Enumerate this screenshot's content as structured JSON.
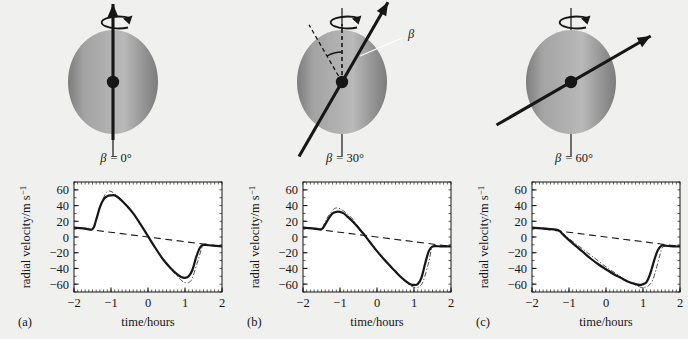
{
  "figure": {
    "background_color": "#f0f0ee",
    "ink_color": "#161616",
    "sphere_light_color": "#b9b9b9",
    "sphere_dark_color": "#7d7d7d",
    "panel_count": 3
  },
  "panels": [
    {
      "letter": "(a)",
      "beta_label": "β = 0°",
      "beta_symbol": "β",
      "beta_value_text": "= 0°",
      "beta_degrees": 0,
      "arrow_angle_from_vertical_deg": 90,
      "has_angle_arc": false,
      "has_beta_leader": false
    },
    {
      "letter": "(b)",
      "beta_label": "β = 30°",
      "beta_symbol": "β",
      "beta_value_text": "= 30°",
      "beta_degrees": 30,
      "arrow_angle_from_vertical_deg": 60,
      "has_angle_arc": true,
      "has_beta_leader": true
    },
    {
      "letter": "(c)",
      "beta_label": "β = 60°",
      "beta_symbol": "β",
      "beta_value_text": "= 60°",
      "beta_degrees": 60,
      "arrow_angle_from_vertical_deg": 30,
      "has_angle_arc": false,
      "has_beta_leader": false
    }
  ],
  "axis": {
    "ylabel_parts": {
      "main": "radial velocity/m s",
      "exponent": "−1"
    },
    "ylabel_full": "radial velocity/m s−1",
    "xlabel": "time/hours",
    "x_ticks": [
      -2,
      -1,
      0,
      1,
      2
    ],
    "x_tick_labels": [
      "−2",
      "−1",
      "0",
      "1",
      "2"
    ],
    "y_ticks": [
      60,
      40,
      20,
      0,
      -20,
      -40,
      -60
    ],
    "y_tick_labels": [
      "60",
      "40",
      "20",
      "0",
      "−20",
      "−40",
      "−60"
    ],
    "xlim": [
      -2,
      2
    ],
    "ylim": [
      -70,
      70
    ],
    "minor_ticks_per_interval": 10,
    "grid": false,
    "frame": true
  },
  "chart_data": [
    {
      "type": "line",
      "title": "",
      "panel": "(a)",
      "xlabel": "time/hours",
      "ylabel": "radial velocity/m s−1",
      "xlim": [
        -2,
        2
      ],
      "ylim": [
        -70,
        70
      ],
      "grid": false,
      "series": [
        {
          "name": "rotation baseline (dashed)",
          "style": "dashed",
          "x": [
            -2,
            2
          ],
          "values": [
            12,
            -12
          ]
        },
        {
          "name": "model radial velocity (solid)",
          "style": "solid",
          "x": [
            -2.0,
            -1.75,
            -1.5,
            -1.4,
            -1.3,
            -1.2,
            -1.1,
            -1.0,
            -0.9,
            -0.8,
            -0.6,
            -0.4,
            -0.2,
            0.0,
            0.2,
            0.4,
            0.6,
            0.8,
            0.9,
            1.0,
            1.1,
            1.2,
            1.3,
            1.4,
            1.5,
            1.75,
            2.0
          ],
          "values": [
            12,
            11,
            10,
            22,
            38,
            48,
            52,
            53,
            53,
            50,
            41,
            30,
            16,
            1,
            -14,
            -28,
            -39,
            -48,
            -51,
            -52,
            -50,
            -42,
            -26,
            -14,
            -10,
            -11,
            -12
          ]
        },
        {
          "name": "reference curve (dash-dot)",
          "style": "dashdot",
          "x": [
            -2.0,
            -1.6,
            -1.5,
            -1.35,
            -1.2,
            -1.1,
            -1.0,
            -0.9,
            -0.7,
            -0.5,
            -0.25,
            0.0,
            0.25,
            0.5,
            0.7,
            0.9,
            1.0,
            1.1,
            1.2,
            1.35,
            1.5,
            1.7,
            2.0
          ],
          "values": [
            12,
            11,
            10,
            30,
            50,
            58,
            58,
            55,
            47,
            36,
            20,
            1,
            -18,
            -34,
            -45,
            -55,
            -58,
            -58,
            -52,
            -30,
            -10,
            -11,
            -12
          ]
        }
      ]
    },
    {
      "type": "line",
      "title": "",
      "panel": "(b)",
      "xlabel": "time/hours",
      "ylabel": "radial velocity/m s−1",
      "xlim": [
        -2,
        2
      ],
      "ylim": [
        -70,
        70
      ],
      "grid": false,
      "series": [
        {
          "name": "rotation baseline (dashed)",
          "style": "dashed",
          "x": [
            -2,
            2
          ],
          "values": [
            12,
            -12
          ]
        },
        {
          "name": "model radial velocity (solid)",
          "style": "solid",
          "x": [
            -2.0,
            -1.75,
            -1.5,
            -1.4,
            -1.3,
            -1.2,
            -1.1,
            -1.0,
            -0.9,
            -0.8,
            -0.6,
            -0.4,
            -0.2,
            0.0,
            0.2,
            0.4,
            0.6,
            0.8,
            0.9,
            1.0,
            1.1,
            1.2,
            1.3,
            1.4,
            1.5,
            1.75,
            2.0
          ],
          "values": [
            12,
            11,
            10,
            16,
            24,
            30,
            32,
            32,
            30,
            26,
            17,
            6,
            -6,
            -18,
            -29,
            -39,
            -49,
            -57,
            -60,
            -61,
            -60,
            -52,
            -34,
            -18,
            -12,
            -12,
            -12
          ]
        },
        {
          "name": "reference curve (dash-dot)",
          "style": "dashdot",
          "x": [
            -2.0,
            -1.6,
            -1.5,
            -1.35,
            -1.2,
            -1.1,
            -1.0,
            -0.9,
            -0.7,
            -0.5,
            -0.25,
            0.0,
            0.25,
            0.5,
            0.75,
            0.95,
            1.05,
            1.15,
            1.25,
            1.4,
            1.5,
            1.7,
            2.0
          ],
          "values": [
            12,
            11,
            10,
            24,
            34,
            37,
            36,
            33,
            25,
            13,
            -2,
            -18,
            -32,
            -45,
            -56,
            -63,
            -64,
            -63,
            -56,
            -32,
            -12,
            -12,
            -12
          ]
        }
      ]
    },
    {
      "type": "line",
      "title": "",
      "panel": "(c)",
      "xlabel": "time/hours",
      "ylabel": "radial velocity/m s−1",
      "xlim": [
        -2,
        2
      ],
      "ylim": [
        -70,
        70
      ],
      "grid": false,
      "series": [
        {
          "name": "rotation baseline (dashed)",
          "style": "dashed",
          "x": [
            -2,
            2
          ],
          "values": [
            12,
            -12
          ]
        },
        {
          "name": "model radial velocity (solid)",
          "style": "solid",
          "x": [
            -2.0,
            -1.75,
            -1.5,
            -1.3,
            -1.2,
            -1.0,
            -0.8,
            -0.6,
            -0.4,
            -0.2,
            0.0,
            0.2,
            0.4,
            0.6,
            0.8,
            0.9,
            1.0,
            1.1,
            1.2,
            1.3,
            1.4,
            1.5,
            1.6,
            1.8,
            2.0
          ],
          "values": [
            12,
            11,
            10,
            9,
            5,
            -4,
            -12,
            -20,
            -28,
            -35,
            -41,
            -47,
            -52,
            -57,
            -60,
            -61,
            -60,
            -57,
            -46,
            -30,
            -17,
            -11,
            -11,
            -12,
            -12
          ]
        },
        {
          "name": "reference curve (dash-dot)",
          "style": "dashdot",
          "x": [
            -2.0,
            -1.6,
            -1.4,
            -1.25,
            -1.0,
            -0.75,
            -0.5,
            -0.25,
            0.0,
            0.25,
            0.5,
            0.75,
            0.95,
            1.05,
            1.15,
            1.25,
            1.35,
            1.45,
            1.55,
            1.75,
            2.0
          ],
          "values": [
            12,
            11,
            10,
            7,
            -2,
            -11,
            -20,
            -29,
            -38,
            -46,
            -54,
            -60,
            -64,
            -64,
            -62,
            -56,
            -42,
            -24,
            -12,
            -12,
            -12
          ]
        }
      ]
    }
  ]
}
